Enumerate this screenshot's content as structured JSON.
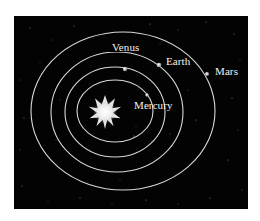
{
  "diagram": {
    "title": "",
    "background_color": "#030303",
    "orbit_color": "#d8d8d8",
    "label_color": "#f2f2f2",
    "sun": {
      "name": "Sun",
      "icon": "sun-star-icon",
      "cx": 105,
      "cy": 112
    },
    "planets": [
      {
        "name": "Mercury",
        "label": "Mercury",
        "orbit": {
          "cx": 115,
          "cy": 111,
          "rx": 38,
          "ry": 31
        },
        "dot": {
          "x": 147,
          "y": 95,
          "r": 1.8
        },
        "label_pos": {
          "x": 134,
          "y": 100
        }
      },
      {
        "name": "Venus",
        "label": "Venus",
        "orbit": {
          "cx": 115,
          "cy": 112,
          "rx": 50,
          "ry": 45
        },
        "dot": {
          "x": 125,
          "y": 69,
          "r": 2.2
        },
        "label_pos": {
          "x": 111,
          "y": 49
        }
      },
      {
        "name": "Earth",
        "label": "Earth",
        "orbit": {
          "cx": 117,
          "cy": 112,
          "rx": 66,
          "ry": 60
        },
        "dot": {
          "x": 159,
          "y": 65,
          "r": 2.3
        },
        "label_pos": {
          "x": 166,
          "y": 56
        }
      },
      {
        "name": "Mars",
        "label": "Mars",
        "orbit": {
          "cx": 123,
          "cy": 111,
          "rx": 92,
          "ry": 79
        },
        "dot": {
          "x": 207,
          "y": 74,
          "r": 2.0
        },
        "label_pos": {
          "x": 215,
          "y": 66
        }
      }
    ]
  }
}
